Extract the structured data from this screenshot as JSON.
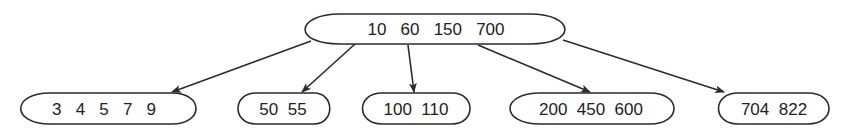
{
  "diagram": {
    "type": "b-tree",
    "root": {
      "id": "root",
      "keys": [
        "10",
        "60",
        "150",
        "700"
      ],
      "label": "10   60   150   700"
    },
    "children": [
      {
        "id": "leaf-1",
        "keys": [
          "3",
          "4",
          "5",
          "7",
          "9"
        ],
        "label": "3   4   5   7   9"
      },
      {
        "id": "leaf-2",
        "keys": [
          "50",
          "55"
        ],
        "label": "50  55"
      },
      {
        "id": "leaf-3",
        "keys": [
          "100",
          "110"
        ],
        "label": "100  110"
      },
      {
        "id": "leaf-4",
        "keys": [
          "200",
          "450",
          "600"
        ],
        "label": "200  450  600"
      },
      {
        "id": "leaf-5",
        "keys": [
          "704",
          "822"
        ],
        "label": "704  822"
      }
    ],
    "edges": [
      {
        "from": "root",
        "to": "leaf-1"
      },
      {
        "from": "root",
        "to": "leaf-2"
      },
      {
        "from": "root",
        "to": "leaf-3"
      },
      {
        "from": "root",
        "to": "leaf-4"
      },
      {
        "from": "root",
        "to": "leaf-5"
      }
    ],
    "colors": {
      "stroke": "#2b2b2b",
      "text": "#222222",
      "background": "#ffffff"
    }
  }
}
